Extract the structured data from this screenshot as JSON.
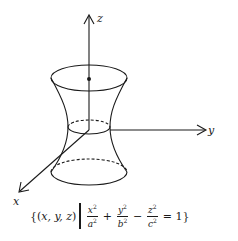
{
  "figure": {
    "axes": {
      "z_label": "z",
      "y_label": "y",
      "x_label": "x"
    },
    "colors": {
      "stroke": "#1a1a1a",
      "background": "#ffffff"
    }
  },
  "formula": {
    "set_open": "{(",
    "vars": "x, y, z",
    "set_close_paren": ")",
    "term1_num": "x",
    "term1_den": "a",
    "plus": "+",
    "term2_num": "y",
    "term2_den": "b",
    "minus": "−",
    "term3_num": "z",
    "term3_den": "c",
    "equals": "= 1}",
    "exponent": "2"
  }
}
